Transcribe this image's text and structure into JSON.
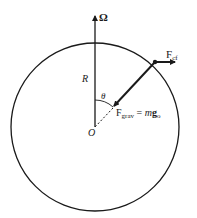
{
  "diagram": {
    "labels": {
      "omega": "Ω",
      "radius": "R",
      "angle": "θ",
      "origin": "O",
      "f_cf_main": "F",
      "f_cf_sub": "cf",
      "f_grav_main": "F",
      "f_grav_sub": "grav",
      "f_grav_eq": " = ",
      "f_grav_m": "m",
      "f_grav_g": "g",
      "f_grav_gsub": "o"
    },
    "colors": {
      "stroke": "#1a1a1a",
      "background": "#ffffff"
    }
  }
}
